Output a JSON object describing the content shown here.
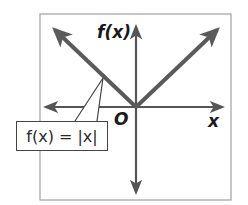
{
  "diagram": {
    "axis_labels": {
      "y": "f(x)",
      "x": "x",
      "origin": "O"
    },
    "function_label": "f(x) = |x|",
    "colors": {
      "frame": "#9a9a9a",
      "axes": "#555555",
      "graph": "#5a5a5a",
      "text": "#1a1a1a",
      "background": "#ffffff"
    },
    "geometry": {
      "frame": {
        "x1": 40,
        "y1": 14,
        "x2": 231,
        "y2": 200
      },
      "origin": {
        "x": 136,
        "y": 107
      },
      "y_axis": {
        "top": 27,
        "bottom": 192
      },
      "x_axis": {
        "left": 45,
        "right": 222
      },
      "left_branch_tip": {
        "x": 53,
        "y": 28
      },
      "right_branch_tip": {
        "x": 220,
        "y": 27
      },
      "callout_target": {
        "x": 103,
        "y": 78
      }
    }
  }
}
